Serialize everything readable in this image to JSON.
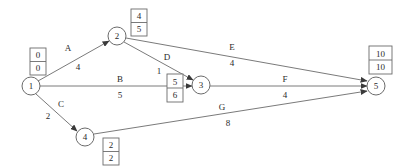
{
  "diagram": {
    "type": "activity-on-arrow-network",
    "title": "",
    "canvas": {
      "width": 401,
      "height": 168
    },
    "colors": {
      "background": "#ffffff",
      "stroke": "#6b6b6b",
      "text": "#2b2b2b"
    },
    "nodes": [
      {
        "id": "1",
        "label": "1",
        "cx": 31,
        "cy": 86,
        "r": 9
      },
      {
        "id": "2",
        "label": "2",
        "cx": 117,
        "cy": 36,
        "r": 9
      },
      {
        "id": "3",
        "label": "3",
        "cx": 201,
        "cy": 85,
        "r": 9
      },
      {
        "id": "4",
        "label": "4",
        "cx": 85,
        "cy": 137,
        "r": 9
      },
      {
        "id": "5",
        "label": "5",
        "cx": 376,
        "cy": 86,
        "r": 9
      }
    ],
    "time_boxes": [
      {
        "node": "1",
        "earliest": "0",
        "latest": "0",
        "x": 30,
        "y": 48,
        "w": 16,
        "h": 27
      },
      {
        "node": "2",
        "earliest": "4",
        "latest": "5",
        "x": 131,
        "y": 9,
        "w": 16,
        "h": 27
      },
      {
        "node": "3",
        "earliest": "5",
        "latest": "6",
        "x": 167,
        "y": 74,
        "w": 16,
        "h": 28
      },
      {
        "node": "4",
        "earliest": "2",
        "latest": "2",
        "x": 103,
        "y": 138,
        "w": 16,
        "h": 27
      },
      {
        "node": "5",
        "earliest": "10",
        "latest": "10",
        "x": 369,
        "y": 46,
        "w": 23,
        "h": 28
      }
    ],
    "edges": [
      {
        "id": "A",
        "activity": "A",
        "duration": "4",
        "from": "1",
        "to": "2",
        "x1": 38,
        "y1": 81,
        "x2": 109,
        "y2": 41,
        "label_x": 68,
        "label_y": 48,
        "dur_x": 78,
        "dur_y": 67
      },
      {
        "id": "B",
        "activity": "B",
        "duration": "5",
        "from": "1",
        "to": "3",
        "x1": 40,
        "y1": 86,
        "x2": 192,
        "y2": 86,
        "label_x": 120,
        "label_y": 79,
        "dur_x": 120,
        "dur_y": 95
      },
      {
        "id": "C",
        "activity": "C",
        "duration": "2",
        "from": "1",
        "to": "4",
        "x1": 36,
        "y1": 94,
        "x2": 77,
        "y2": 131,
        "label_x": 61,
        "label_y": 104,
        "dur_x": 48,
        "dur_y": 116
      },
      {
        "id": "D",
        "activity": "D",
        "duration": "1",
        "from": "2",
        "to": "3",
        "x1": 124,
        "y1": 42,
        "x2": 193,
        "y2": 80,
        "label_x": 167,
        "label_y": 57,
        "dur_x": 159,
        "dur_y": 71
      },
      {
        "id": "E",
        "activity": "E",
        "duration": "4",
        "from": "2",
        "to": "5",
        "x1": 126,
        "y1": 38,
        "x2": 367,
        "y2": 81,
        "label_x": 232,
        "label_y": 47,
        "dur_x": 232,
        "dur_y": 63
      },
      {
        "id": "F",
        "activity": "F",
        "duration": "4",
        "from": "3",
        "to": "5",
        "x1": 210,
        "y1": 86,
        "x2": 367,
        "y2": 86,
        "label_x": 285,
        "label_y": 79,
        "dur_x": 285,
        "dur_y": 95
      },
      {
        "id": "G",
        "activity": "G",
        "duration": "8",
        "from": "4",
        "to": "5",
        "x1": 94,
        "y1": 134,
        "x2": 367,
        "y2": 91,
        "label_x": 222,
        "label_y": 107,
        "dur_x": 228,
        "dur_y": 123
      }
    ]
  }
}
